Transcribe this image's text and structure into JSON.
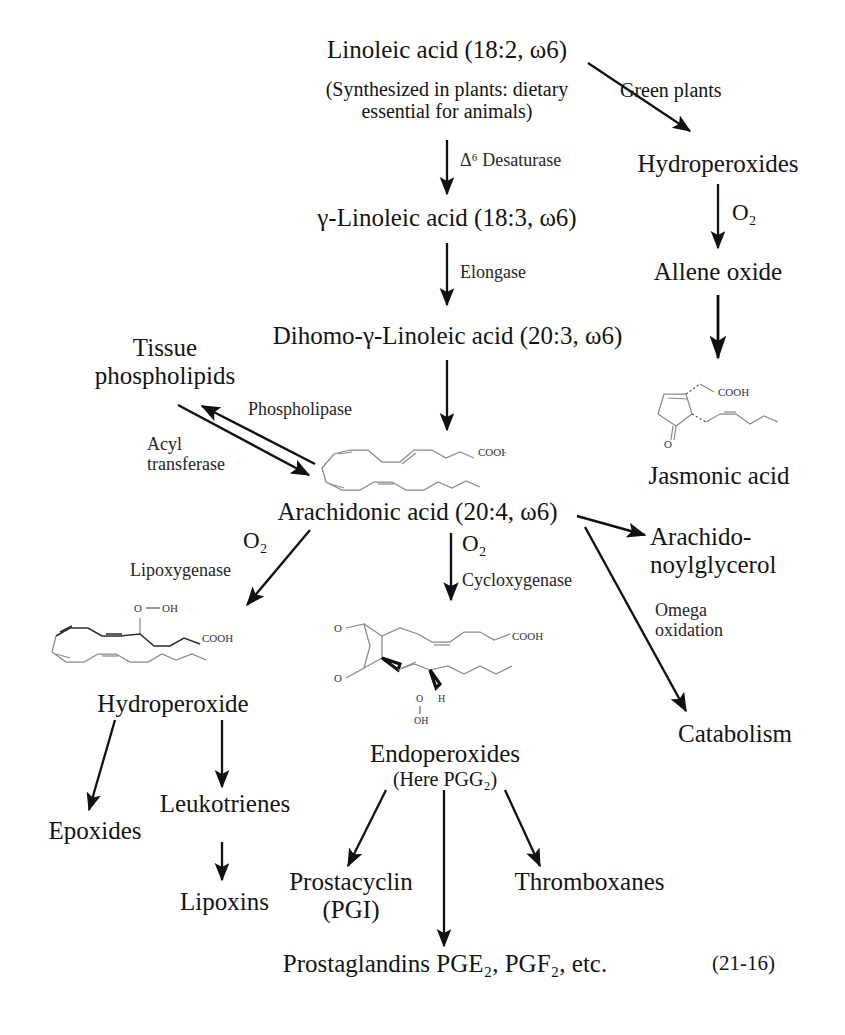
{
  "figure": {
    "plate_number": "(21-16)",
    "arrow_color": "#111111",
    "text_color": "#141414",
    "structure_color": "#8a8a8a"
  },
  "nodes": {
    "linoleic_acid": "Linoleic acid (18:2, ω6)",
    "linoleic_note_line1": "(Synthesized in plants: dietary",
    "linoleic_note_line2": "essential for animals)",
    "gamma_linoleic_acid": "γ-Linoleic acid (18:3, ω6)",
    "dihomo_gamma_linoleic_acid": "Dihomo-γ-Linoleic acid (20:3, ω6)",
    "arachidonic_acid": "Arachidonic acid (20:4, ω6)",
    "tissue_phospholipids_line1": "Tissue",
    "tissue_phospholipids_line2": "phospholipids",
    "hydroperoxides": "Hydroperoxides",
    "allene_oxide": "Allene oxide",
    "jasmonic_acid": "Jasmonic acid",
    "arachidonoylglycerol_line1": "Arachido-",
    "arachidonoylglycerol_line2": "noylglycerol",
    "catabolism": "Catabolism",
    "hydroperoxide": "Hydroperoxide",
    "epoxides": "Epoxides",
    "leukotrienes": "Leukotrienes",
    "lipoxins": "Lipoxins",
    "endoperoxides": "Endoperoxides",
    "endoperoxides_note": "(Here PGG₂)",
    "prostacyclin_line1": "Prostacyclin",
    "prostacyclin_line2": "(PGI)",
    "thromboxanes": "Thromboxanes",
    "prostaglandins": "Prostaglandins PGE₂, PGF₂, etc."
  },
  "enzymes": {
    "delta6_desaturase": "Δ⁶ Desaturase",
    "elongase": "Elongase",
    "phospholipase": "Phospholipase",
    "acyl_transferase_line1": "Acyl",
    "acyl_transferase_line2": "transferase",
    "green_plants": "Green plants",
    "lipoxygenase": "Lipoxygenase",
    "cycloxygenase": "Cycloxygenase",
    "omega_oxidation_line1": "Omega",
    "omega_oxidation_line2": "oxidation",
    "o2_allene": "O₂",
    "o2_lipoxygenase": "O₂",
    "o2_cycloxygenase": "O₂"
  },
  "structure_labels": {
    "arachidonic_cooh": "COOH",
    "jasmonic_cooh": "COOH",
    "jasmonic_o": "O",
    "hydroperoxide_o": "O",
    "hydroperoxide_oh": "OH",
    "hydroperoxide_cooh": "COOH",
    "pgg2_cooh": "COOH",
    "pgg2_o_top": "O",
    "pgg2_o_bottom": "O",
    "pgg2_o": "O",
    "pgg2_h": "H",
    "pgg2_oh": "OH"
  }
}
